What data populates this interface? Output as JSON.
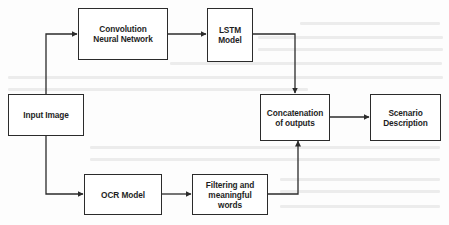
{
  "diagram": {
    "type": "flowchart",
    "nodes": {
      "input": {
        "label": "Input Image"
      },
      "cnn": {
        "label": "Convolution Neural Network"
      },
      "lstm": {
        "label": "LSTM Model"
      },
      "ocr": {
        "label": "OCR Model"
      },
      "filter": {
        "label": "Filtering and meaningful words"
      },
      "concat": {
        "label": "Concatenation of outputs"
      },
      "scenario": {
        "label": "Scenario Description"
      }
    },
    "edges": [
      {
        "from": "Input Image",
        "to": "Convolution Neural Network"
      },
      {
        "from": "Convolution Neural Network",
        "to": "LSTM Model"
      },
      {
        "from": "LSTM Model",
        "to": "Concatenation of outputs"
      },
      {
        "from": "Input Image",
        "to": "OCR Model"
      },
      {
        "from": "OCR Model",
        "to": "Filtering and meaningful words"
      },
      {
        "from": "Filtering and meaningful words",
        "to": "Concatenation of outputs"
      },
      {
        "from": "Concatenation of outputs",
        "to": "Scenario Description"
      }
    ],
    "colors": {
      "stroke": "#2b2b2b",
      "text": "#1e1e1e",
      "background": "#ffffff"
    }
  }
}
